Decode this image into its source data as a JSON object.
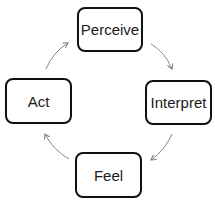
{
  "diagram": {
    "type": "cycle",
    "nodes": [
      {
        "id": "perceive",
        "label": "Perceive"
      },
      {
        "id": "interpret",
        "label": "Interpret"
      },
      {
        "id": "feel",
        "label": "Feel"
      },
      {
        "id": "act",
        "label": "Act"
      }
    ],
    "edges": [
      {
        "from": "perceive",
        "to": "interpret"
      },
      {
        "from": "interpret",
        "to": "feel"
      },
      {
        "from": "feel",
        "to": "act"
      },
      {
        "from": "act",
        "to": "perceive"
      }
    ],
    "colors": {
      "border": "#111111",
      "arrow": "#777777",
      "text": "#1a1a1a"
    }
  }
}
